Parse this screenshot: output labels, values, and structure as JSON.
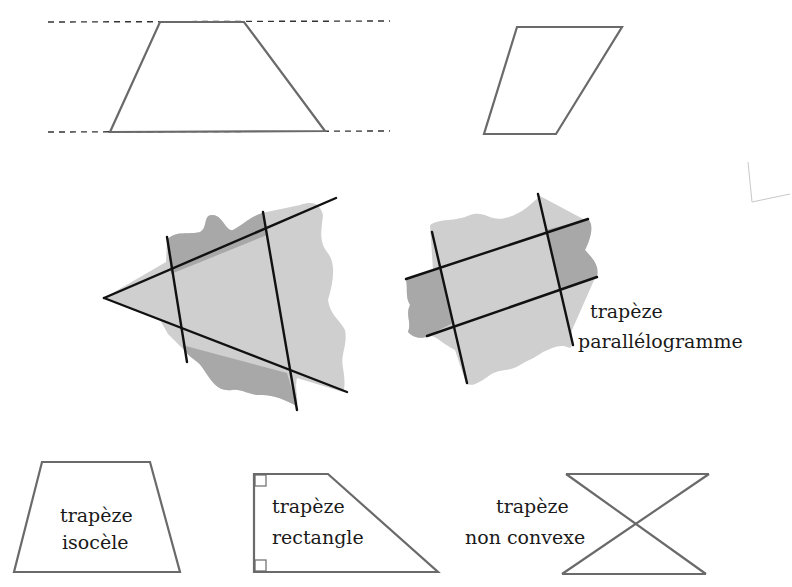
{
  "colors": {
    "outline": "#6a6a6a",
    "cut_line": "#111111",
    "shade_light": "#cfcfcf",
    "shade_dark": "#a8a8a8",
    "text": "#1a1a1a"
  },
  "top_row": {
    "trapezoid_between_parallels": {
      "points": "160,22 244,22 325,131 110,132",
      "dashed_top": {
        "x1": 48,
        "y1": 22,
        "x2": 390,
        "y2": 21
      },
      "dashed_bottom": {
        "x1": 48,
        "y1": 132,
        "x2": 390,
        "y2": 131
      }
    },
    "parallelogram": {
      "points": "517,27 622,27 556,134 484,134"
    }
  },
  "middle_row": {
    "triangle_cut": {
      "blob_path": "M167,240 C175,230 190,235 200,232 C208,228 203,215 212,215 C222,214 226,232 233,230 C243,225 248,218 262,213 L300,205 C315,200 320,205 323,215 C322,228 318,240 327,252 C336,262 334,280 328,300 C330,315 340,320 345,330 C348,345 340,355 343,368 C345,380 345,388 343,392 L297,378 C294,390 300,402 296,406 C285,400 275,395 262,395 C250,396 242,388 232,390 C218,392 212,382 204,370 C198,360 192,360 186,352 L168,334 L160,320 L104,298 L166,262 Z",
      "dark_top": "M167,240 C175,230 190,235 200,232 C208,228 203,215 212,215 C222,214 226,232 233,230 C243,225 248,218 262,213 L267,235 L171,274 Z",
      "dark_bottom": "M182,345 L287,373 L297,406 C285,400 275,395 262,395 C250,396 242,388 232,390 C218,392 212,382 204,370 C198,360 192,360 186,352 Z",
      "lines": [
        {
          "x1": 104,
          "y1": 298,
          "x2": 336,
          "y2": 198
        },
        {
          "x1": 104,
          "y1": 298,
          "x2": 347,
          "y2": 392
        },
        {
          "x1": 167,
          "y1": 237,
          "x2": 187,
          "y2": 362
        },
        {
          "x1": 263,
          "y1": 212,
          "x2": 297,
          "y2": 410
        }
      ]
    },
    "parallelogram_cut": {
      "blob_path": "M430,225 C440,218 455,222 470,215 C485,210 490,222 505,218 C520,215 530,205 540,196 L585,220 C595,225 590,240 585,250 C592,258 600,265 595,278 L572,330 C570,340 574,345 570,348 C560,343 552,348 543,352 C535,358 528,360 520,365 C510,372 500,368 490,375 C480,382 472,388 466,383 L455,350 C445,345 438,338 432,336 C425,338 415,340 408,332 C412,322 405,315 410,305 C405,296 408,290 406,279 L433,270 Z",
      "dark_left": "M406,279 L441,268 L453,323 L427,336 C425,338 415,340 408,332 C412,322 405,315 410,305 C405,296 408,290 406,279 Z",
      "dark_right": "M546,230 L588,219 C595,225 590,240 585,250 C592,258 600,265 597,277 L560,290 Z",
      "lines": [
        {
          "x1": 432,
          "y1": 232,
          "x2": 467,
          "y2": 383
        },
        {
          "x1": 538,
          "y1": 194,
          "x2": 573,
          "y2": 345
        },
        {
          "x1": 406,
          "y1": 279,
          "x2": 588,
          "y2": 219
        },
        {
          "x1": 427,
          "y1": 336,
          "x2": 597,
          "y2": 277
        }
      ]
    },
    "label": {
      "line1": "trapèze",
      "line2": "parallélogramme"
    }
  },
  "bottom_row": {
    "isosceles": {
      "points": "42,462 150,462 180,572 14,572",
      "label": {
        "line1": "trapèze",
        "line2": "isocèle"
      }
    },
    "right_trapezoid": {
      "points": "254,474 328,474 438,572 254,572",
      "label": {
        "line1": "trapèze",
        "line2": "rectangle"
      }
    },
    "crossed": {
      "top": {
        "x1": 566,
        "y1": 474,
        "x2": 709,
        "y2": 474
      },
      "bottom": {
        "x1": 562,
        "y1": 574,
        "x2": 706,
        "y2": 574
      },
      "diag1": {
        "x1": 566,
        "y1": 474,
        "x2": 706,
        "y2": 574
      },
      "diag2": {
        "x1": 709,
        "y1": 474,
        "x2": 562,
        "y2": 574
      },
      "label": {
        "line1": "trapèze",
        "line2": "non convexe"
      }
    }
  }
}
